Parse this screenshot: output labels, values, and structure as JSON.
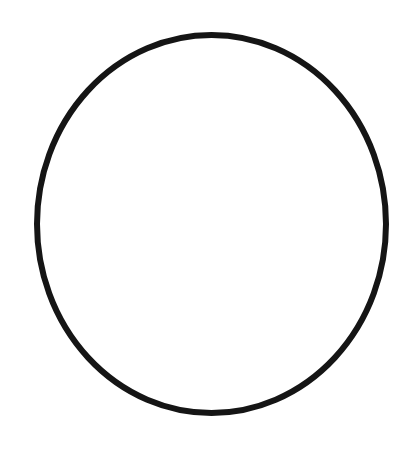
{
  "canvas": {
    "width": 418,
    "height": 453,
    "background": "#ffffff"
  },
  "shape": {
    "type": "ellipse",
    "cx": 211.5,
    "cy": 224,
    "rx": 174.5,
    "ry": 189,
    "stroke": "#151515",
    "stroke_width": 6,
    "fill": "none"
  }
}
